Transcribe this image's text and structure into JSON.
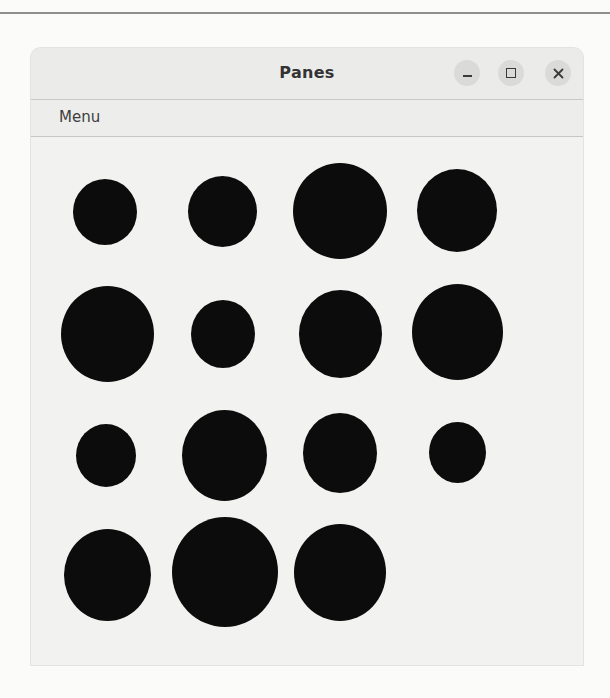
{
  "window": {
    "title": "Panes",
    "controls": {
      "minimize_icon": "minimize-icon",
      "maximize_icon": "maximize-icon",
      "close_icon": "close-icon",
      "close_glyph": "✕"
    }
  },
  "menubar": {
    "items": [
      {
        "label": "Menu"
      }
    ]
  },
  "canvas": {
    "fill_color": "#0c0c0c",
    "background": "#f2f2f1",
    "grid": {
      "columns": 4,
      "rows": 4
    },
    "circles": [
      {
        "row": 1,
        "col": 1,
        "cx": 105,
        "cy": 212,
        "w": 64,
        "h": 66
      },
      {
        "row": 1,
        "col": 2,
        "cx": 222,
        "cy": 211,
        "w": 69,
        "h": 71
      },
      {
        "row": 1,
        "col": 3,
        "cx": 340,
        "cy": 211,
        "w": 94,
        "h": 96
      },
      {
        "row": 1,
        "col": 4,
        "cx": 457,
        "cy": 210,
        "w": 80,
        "h": 83
      },
      {
        "row": 2,
        "col": 1,
        "cx": 107,
        "cy": 334,
        "w": 93,
        "h": 96
      },
      {
        "row": 2,
        "col": 2,
        "cx": 223,
        "cy": 334,
        "w": 64,
        "h": 68
      },
      {
        "row": 2,
        "col": 3,
        "cx": 340,
        "cy": 334,
        "w": 83,
        "h": 88
      },
      {
        "row": 2,
        "col": 4,
        "cx": 457,
        "cy": 332,
        "w": 91,
        "h": 96
      },
      {
        "row": 3,
        "col": 1,
        "cx": 106,
        "cy": 455,
        "w": 60,
        "h": 63
      },
      {
        "row": 3,
        "col": 2,
        "cx": 224,
        "cy": 455,
        "w": 85,
        "h": 91
      },
      {
        "row": 3,
        "col": 3,
        "cx": 340,
        "cy": 453,
        "w": 74,
        "h": 80
      },
      {
        "row": 3,
        "col": 4,
        "cx": 457,
        "cy": 452,
        "w": 57,
        "h": 61
      },
      {
        "row": 4,
        "col": 1,
        "cx": 107,
        "cy": 575,
        "w": 87,
        "h": 92
      },
      {
        "row": 4,
        "col": 2,
        "cx": 225,
        "cy": 572,
        "w": 106,
        "h": 110
      },
      {
        "row": 4,
        "col": 3,
        "cx": 340,
        "cy": 572,
        "w": 92,
        "h": 97
      }
    ]
  }
}
